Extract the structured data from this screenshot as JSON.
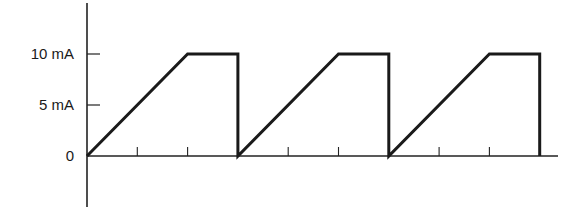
{
  "chart_data": {
    "type": "line",
    "title": "",
    "xlabel": "",
    "ylabel": "",
    "y_tick_labels": [
      "0",
      "5 mA",
      "10 mA"
    ],
    "y_ticks": [
      0,
      5,
      10
    ],
    "x_ticks": [
      1,
      2,
      4,
      5,
      7,
      8
    ],
    "xlim": [
      0,
      9.4
    ],
    "ylim": [
      -5,
      15
    ],
    "grid": false,
    "legend": null,
    "series": [
      {
        "name": "current",
        "x": [
          0,
          2,
          3,
          3,
          5,
          6,
          6,
          8,
          9,
          9
        ],
        "y": [
          0,
          10,
          10,
          0,
          10,
          10,
          0,
          10,
          10,
          0
        ]
      }
    ]
  },
  "labels": {
    "y10": "10 mA",
    "y5": "5 mA",
    "y0": "0"
  },
  "style": {
    "line_color": "#1a1a1a",
    "background": "#ffffff"
  }
}
